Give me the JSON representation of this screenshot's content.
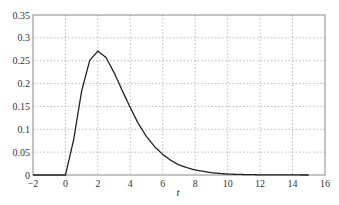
{
  "chart_data": {
    "type": "line",
    "title": "",
    "xlabel": "t",
    "ylabel": "",
    "xlim": [
      -2,
      16
    ],
    "ylim": [
      0,
      0.35
    ],
    "grid": true,
    "x_ticks": [
      "-2",
      "0",
      "2",
      "4",
      "6",
      "8",
      "10",
      "12",
      "14",
      "16"
    ],
    "y_ticks": [
      "0",
      "0.05",
      "0.1",
      "0.15",
      "0.2",
      "0.25",
      "0.3",
      "0.35"
    ],
    "series": [
      {
        "name": "f(t)",
        "x": [
          -2,
          -1,
          0,
          0.5,
          1,
          1.5,
          2,
          2.5,
          3,
          3.5,
          4,
          4.5,
          5,
          5.5,
          6,
          6.5,
          7,
          7.5,
          8,
          9,
          10,
          11,
          12,
          13,
          14,
          15
        ],
        "y": [
          0,
          0,
          0,
          0.076,
          0.184,
          0.251,
          0.271,
          0.257,
          0.224,
          0.185,
          0.147,
          0.112,
          0.084,
          0.062,
          0.045,
          0.032,
          0.022,
          0.016,
          0.011,
          0.005,
          0.002,
          0.001,
          0.0004,
          0.0002,
          0.0001,
          0
        ]
      }
    ]
  }
}
